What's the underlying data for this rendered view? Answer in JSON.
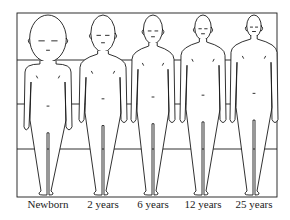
{
  "diagram": {
    "type": "body-proportion-comparison",
    "frame": {
      "x": 17,
      "y": 13,
      "width": 260,
      "height": 184
    },
    "grid_lines_y": [
      13,
      60,
      104,
      149,
      197
    ],
    "figures": [
      {
        "label": "Newborn",
        "cx": 48,
        "head_h": 47,
        "shoulder_w": 46
      },
      {
        "label": "2 years",
        "cx": 103,
        "head_h": 37,
        "shoulder_w": 46
      },
      {
        "label": "6 years",
        "cx": 153,
        "head_h": 29,
        "shoulder_w": 42
      },
      {
        "label": "12 years",
        "cx": 203,
        "head_h": 25,
        "shoulder_w": 44
      },
      {
        "label": "25 years",
        "cx": 254,
        "head_h": 22,
        "shoulder_w": 46
      }
    ],
    "line_color": "#1a1a1a",
    "background": "#ffffff"
  }
}
